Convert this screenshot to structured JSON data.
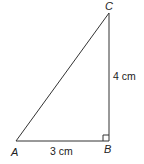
{
  "diagram": {
    "type": "right-triangle",
    "vertices": {
      "A": {
        "label": "A",
        "x": 16,
        "y": 141
      },
      "B": {
        "label": "B",
        "x": 109,
        "y": 141
      },
      "C": {
        "label": "C",
        "x": 109,
        "y": 13
      }
    },
    "sides": {
      "AB": {
        "label": "3 cm"
      },
      "BC": {
        "label": "4 cm"
      }
    },
    "right_angle_at": "B",
    "line_color": "#333333"
  }
}
